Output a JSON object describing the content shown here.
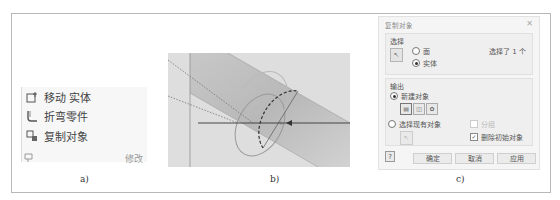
{
  "caption_top": "…的复制对象命令……",
  "panel_a": {
    "items": [
      {
        "icon": "move-body-icon",
        "label": "移动 实体"
      },
      {
        "icon": "bend-part-icon",
        "label": "折弯零件"
      },
      {
        "icon": "copy-object-icon",
        "label": "复制对象"
      }
    ],
    "footer_icon": "pin-icon",
    "footer_label": "修改",
    "sublabel": "a)"
  },
  "panel_b": {
    "sublabel": "b)"
  },
  "panel_c": {
    "title": "复制对象",
    "close_icon": "close-icon",
    "select_group": {
      "title": "选择",
      "options": [
        {
          "label": "面",
          "selected": false
        },
        {
          "label": "实体",
          "selected": true
        }
      ],
      "status": "选择了 1 个"
    },
    "output_group": {
      "title": "输出",
      "new_object": {
        "label": "新建对象",
        "selected": true
      },
      "icon_buttons": [
        "surface-output-icon",
        "composite-output-icon",
        "solid-output-icon"
      ],
      "existing_object": {
        "label": "选择现有对象",
        "selected": false
      },
      "group_checkbox": {
        "label": "分组",
        "checked": false,
        "enabled": false
      },
      "remove_original_checkbox": {
        "label": "删除初始对象",
        "checked": true
      }
    },
    "buttons": {
      "ok": "确定",
      "cancel": "取消",
      "apply": "应用"
    },
    "sublabel": "c)"
  }
}
